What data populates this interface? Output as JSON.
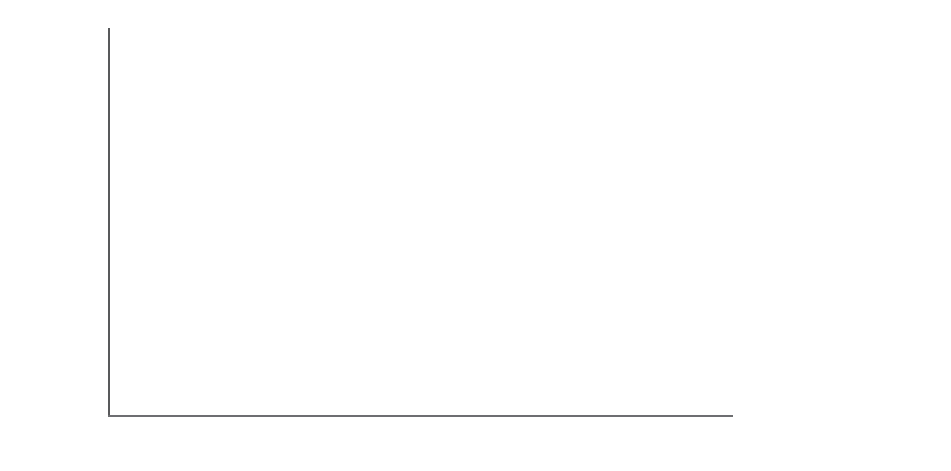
{
  "chart_data": {
    "type": "bar",
    "subtype": "stacked-percentage",
    "title": "",
    "xlabel": "",
    "ylabel": "Percentage in diet",
    "ylim": [
      0,
      100
    ],
    "yticks": [
      "0%",
      "20%",
      "40%",
      "60%",
      "80%",
      "100%"
    ],
    "ytick_values": [
      0,
      20,
      40,
      60,
      80,
      100
    ],
    "grid": false,
    "legend_position": "right",
    "legend": [
      {
        "name": "Herpetofauna",
        "swatch": "white"
      },
      {
        "name": "Birds",
        "swatch": "light-stipple"
      },
      {
        "name": "Lagomorphs",
        "swatch": "dark-gray"
      },
      {
        "name": "Moles",
        "swatch": "mid-gray"
      },
      {
        "name": "Small mammals",
        "swatch": "black"
      }
    ],
    "stack_order_bottom_to_top": [
      "Small mammals",
      "Moles",
      "Lagomorphs",
      "Birds",
      "Herpetofauna"
    ],
    "groups": [
      {
        "label": "Northern",
        "bars": [
          {
            "values": {
              "Small mammals": 70.5,
              "Moles": 22.0,
              "Lagomorphs": 0,
              "Birds": 0,
              "Herpetofauna": 7.5
            }
          },
          {
            "values": {
              "Small mammals": 36.5,
              "Moles": 31.5,
              "Lagomorphs": 0,
              "Birds": 0,
              "Herpetofauna": 32.0
            }
          },
          {
            "values": {
              "Small mammals": 93.5,
              "Moles": 0,
              "Lagomorphs": 2.5,
              "Birds": 4.0,
              "Herpetofauna": 0
            }
          }
        ]
      },
      {
        "label": "Central",
        "bars": [
          {
            "values": {
              "Small mammals": 78.0,
              "Moles": 7.0,
              "Lagomorphs": 0,
              "Birds": 15.0,
              "Herpetofauna": 0
            }
          },
          {
            "values": {
              "Small mammals": 77.0,
              "Moles": 3.0,
              "Lagomorphs": 7.0,
              "Birds": 3.0,
              "Herpetofauna": 10.0
            }
          },
          {
            "values": {
              "Small mammals": 89.5,
              "Moles": 0,
              "Lagomorphs": 0,
              "Birds": 9.0,
              "Herpetofauna": 1.5
            }
          },
          {
            "values": {
              "Small mammals": 86.0,
              "Moles": 12.5,
              "Lagomorphs": 0,
              "Birds": 0,
              "Herpetofauna": 1.5
            }
          },
          {
            "values": {
              "Small mammals": 57.0,
              "Moles": 17.0,
              "Lagomorphs": 3.0,
              "Birds": 13.0,
              "Herpetofauna": 10.0
            }
          }
        ]
      },
      {
        "label": "Atlantic",
        "bars": [
          {
            "values": {
              "Small mammals": 60.0,
              "Moles": 0,
              "Lagomorphs": 21.5,
              "Birds": 17.5,
              "Herpetofauna": 1.0
            }
          },
          {
            "values": {
              "Small mammals": 43.5,
              "Moles": 9.0,
              "Lagomorphs": 23.0,
              "Birds": 16.0,
              "Herpetofauna": 8.5
            }
          },
          {
            "values": {
              "Small mammals": 46.5,
              "Moles": 4.0,
              "Lagomorphs": 22.5,
              "Birds": 7.0,
              "Herpetofauna": 20.0
            }
          }
        ]
      },
      {
        "label": "Southern",
        "bars": [
          {
            "values": {
              "Small mammals": 15.0,
              "Moles": 0,
              "Lagomorphs": 27.0,
              "Birds": 14.5,
              "Herpetofauna": 43.5
            }
          }
        ]
      }
    ],
    "bar_geometry": {
      "plot_left": 108,
      "plot_right": 733,
      "baseline_y": 415,
      "top_y": 28,
      "bar_width": 22,
      "bar_x": [
        128,
        180,
        212,
        296,
        332,
        382,
        424,
        468,
        552,
        588,
        628,
        694
      ],
      "group_label_centers": [
        196,
        384,
        602,
        705
      ]
    }
  }
}
